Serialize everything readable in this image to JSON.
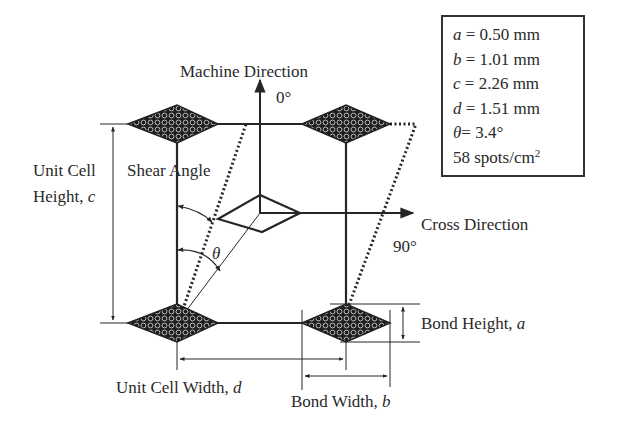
{
  "diagram": {
    "type": "unit-cell-bond-pattern",
    "labels": {
      "machine_direction": "Machine Direction",
      "machine_angle": "0°",
      "cross_direction": "Cross Direction",
      "cross_angle": "90°",
      "shear_angle": "Shear Angle",
      "theta": "θ",
      "unit_cell_height_line1": "Unit Cell",
      "unit_cell_height_line2": "Height, ",
      "unit_cell_height_var": "c",
      "unit_cell_width": "Unit Cell Width, ",
      "unit_cell_width_var": "d",
      "bond_width": "Bond Width, ",
      "bond_width_var": "b",
      "bond_height": "Bond Height, ",
      "bond_height_var": "a"
    },
    "parameters": [
      {
        "symbol": "a",
        "text": " = 0.50 mm"
      },
      {
        "symbol": "b",
        "text": " = 1.01 mm"
      },
      {
        "symbol": "c",
        "text": " = 2.26 mm"
      },
      {
        "symbol": "d",
        "text": " = 1.51 mm"
      },
      {
        "symbol": "θ",
        "text": "= 3.4°"
      }
    ],
    "spot_density": {
      "value": "58 spots/cm",
      "superscript": "2"
    },
    "colors": {
      "line": "#262626",
      "bond_fill": "#1f1f1f",
      "bond_pattern": "#b8b8b8",
      "text": "#2a2a2a"
    }
  }
}
